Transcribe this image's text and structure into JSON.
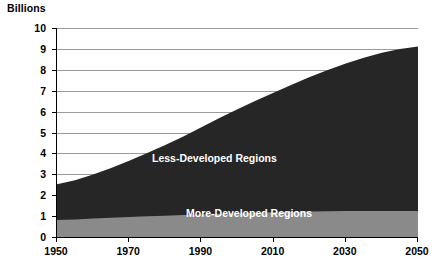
{
  "chart_data": {
    "type": "area",
    "stacked": true,
    "title": "",
    "unit_label": "Billions",
    "xlabel": "",
    "ylabel": "",
    "xlim": [
      1950,
      2050
    ],
    "ylim": [
      0,
      10
    ],
    "x_tick_labels": [
      "1950",
      "1970",
      "1990",
      "2010",
      "2030",
      "2050"
    ],
    "x_ticks": [
      1950,
      1970,
      1990,
      2010,
      2030,
      2050
    ],
    "y_tick_labels": [
      "10",
      "9",
      "8",
      "7",
      "6",
      "5",
      "4",
      "3",
      "2",
      "1",
      "0"
    ],
    "y_ticks": [
      10,
      9,
      8,
      7,
      6,
      5,
      4,
      3,
      2,
      1,
      0
    ],
    "grid": true,
    "grid_axis": "y",
    "legend_position": "inside-plot",
    "x": [
      1950,
      1955,
      1960,
      1965,
      1970,
      1975,
      1980,
      1985,
      1990,
      1995,
      2000,
      2005,
      2010,
      2015,
      2020,
      2025,
      2030,
      2035,
      2040,
      2045,
      2050
    ],
    "series": [
      {
        "name": "More-Developed Regions",
        "color": "#8a8a8a",
        "values": [
          0.81,
          0.84,
          0.88,
          0.92,
          0.96,
          0.99,
          1.02,
          1.05,
          1.08,
          1.11,
          1.14,
          1.16,
          1.18,
          1.2,
          1.22,
          1.23,
          1.24,
          1.25,
          1.25,
          1.25,
          1.25
        ]
      },
      {
        "name": "Less-Developed Regions",
        "color": "#262626",
        "values": [
          1.71,
          1.88,
          2.11,
          2.38,
          2.69,
          3.03,
          3.38,
          3.76,
          4.17,
          4.58,
          4.97,
          5.36,
          5.72,
          6.08,
          6.43,
          6.76,
          7.06,
          7.33,
          7.56,
          7.74,
          7.87
        ]
      }
    ],
    "totals": [
      2.52,
      2.72,
      2.99,
      3.3,
      3.65,
      4.02,
      4.4,
      4.81,
      5.25,
      5.69,
      6.11,
      6.52,
      6.9,
      7.28,
      7.65,
      7.99,
      8.3,
      8.58,
      8.81,
      8.99,
      9.12
    ],
    "annotations": [
      {
        "text": "Less-Developed Regions",
        "color": "#ffffff"
      },
      {
        "text": "More-Developed Regions",
        "color": "#ffffff"
      }
    ]
  }
}
